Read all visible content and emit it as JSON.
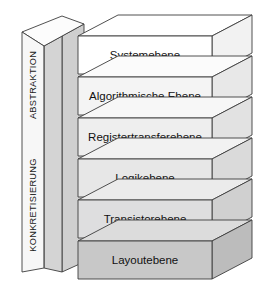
{
  "diagram": {
    "type": "layered-3d-stack",
    "axis_labels": {
      "top": "ABSTRAKTION",
      "bottom": "KONKRETISIERUNG"
    },
    "layers": [
      {
        "label": "Systemebene",
        "face_color": "#ffffff",
        "top_color": "#ffffff",
        "side_color": "#f2f2f2"
      },
      {
        "label": "Algorithmische Ebene",
        "face_color": "#f4f4f4",
        "top_color": "#fbfbfb",
        "side_color": "#e8e8e8"
      },
      {
        "label": "Registertransferebene",
        "face_color": "#eeeeee",
        "top_color": "#f7f7f7",
        "side_color": "#e2e2e2"
      },
      {
        "label": "Logikebene",
        "face_color": "#e7e7e7",
        "top_color": "#f2f2f2",
        "side_color": "#dadada"
      },
      {
        "label": "Transistorebene",
        "face_color": "#dededf",
        "top_color": "#ebebeb",
        "side_color": "#d0d0d0"
      },
      {
        "label": "Layoutebene",
        "face_color": "#c8c8c8",
        "top_color": "#dcdcdc",
        "side_color": "#bcbcbc"
      }
    ],
    "wedge": {
      "front_color": "#d6d6d6",
      "top_color": "#fbfbfb",
      "panel_color": "#f6f6f6"
    },
    "colors": {
      "outline": "#3c3c3c",
      "background": "#ffffff",
      "text": "#111111"
    }
  }
}
